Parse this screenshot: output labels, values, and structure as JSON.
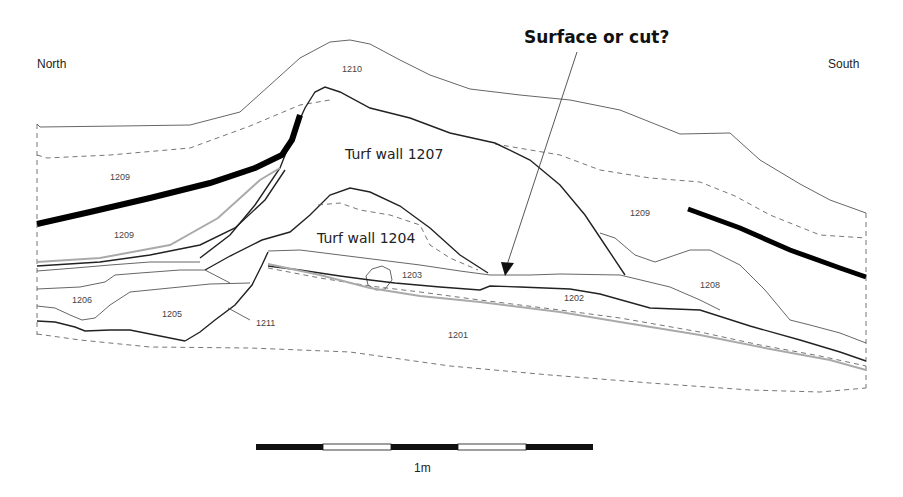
{
  "figure": {
    "type": "archaeological section drawing",
    "orientation": {
      "left": "North",
      "right": "South"
    },
    "annotation": {
      "question": "Surface or cut?"
    },
    "features": {
      "turf_wall_1207": "Turf wall 1207",
      "turf_wall_1204": "Turf wall 1204"
    },
    "contexts": {
      "c1210": "1210",
      "c1209_a": "1209",
      "c1209_b": "1209",
      "c1209_c": "1209",
      "c1208": "1208",
      "c1206": "1206",
      "c1205": "1205",
      "c1211": "1211",
      "c1203": "1203",
      "c1202": "1202",
      "c1201": "1201"
    },
    "scale_bar": {
      "label": "1m",
      "segments": 5,
      "pattern": [
        "black",
        "white",
        "black",
        "white",
        "black"
      ]
    },
    "colors": {
      "line_dark": "#222222",
      "line_thin": "#555555",
      "line_grey": "#aaaaaa",
      "heavy_band": "#000000",
      "background": "#ffffff"
    }
  }
}
